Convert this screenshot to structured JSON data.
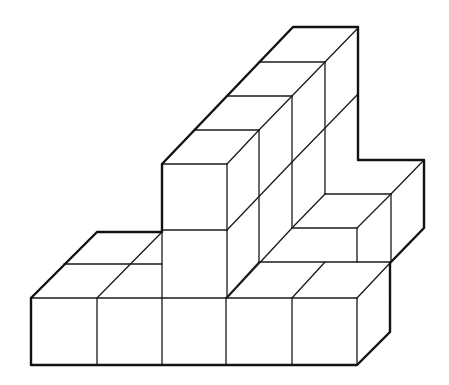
{
  "figure": {
    "type": "isometric-cube-structure",
    "colors": {
      "background": "#ffffff",
      "line": "#1a1a1a"
    },
    "front_row_cube_count": 5
  }
}
